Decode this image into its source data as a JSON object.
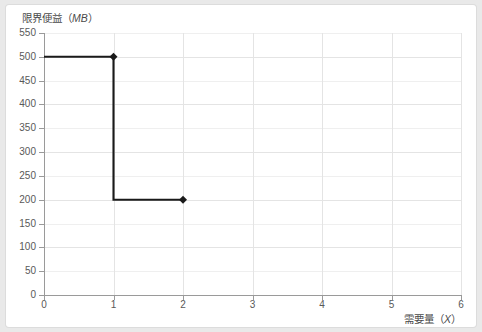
{
  "chart_data": {
    "type": "line",
    "title": "",
    "subtitle": "",
    "ylabel": "限界便益（MB）",
    "ylabel_text": "限界便益",
    "ylabel_unit": "MB",
    "xlabel": "需要量（X）",
    "xlabel_text": "需要量",
    "xlabel_unit": "X",
    "xlim": [
      0,
      6
    ],
    "ylim": [
      0,
      550
    ],
    "xticks": [
      0,
      1,
      2,
      3,
      4,
      5,
      6
    ],
    "yticks": [
      0,
      50,
      100,
      150,
      200,
      250,
      300,
      350,
      400,
      450,
      500,
      550
    ],
    "grid": true,
    "legend": false,
    "legend_position": "none",
    "line_color": "#1a1a1a",
    "marker": "diamond",
    "step_type": "post",
    "series": [
      {
        "name": "限界便益",
        "x": [
          0,
          1,
          1,
          2
        ],
        "values": [
          500,
          500,
          200,
          200
        ]
      }
    ],
    "markers": [
      {
        "x": 1,
        "y": 500
      },
      {
        "x": 2,
        "y": 200
      }
    ],
    "annotations": []
  },
  "style": {
    "page_background": "#e9e9e9",
    "card_background": "#ffffff",
    "grid_color": "#e4e4e4",
    "axis_color": "#9a9a9a",
    "tick_label_color": "#595959",
    "axis_label_color": "#4a4a4a",
    "series_color": "#1a1a1a"
  }
}
